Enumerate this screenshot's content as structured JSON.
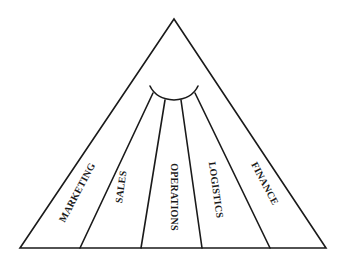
{
  "diagram": {
    "type": "pyramid-segments",
    "shape": "triangle",
    "segments": [
      {
        "label": "MARKETING"
      },
      {
        "label": "SALES"
      },
      {
        "label": "OPERATIONS"
      },
      {
        "label": "LOGISTICS"
      },
      {
        "label": "FINANCE"
      }
    ],
    "connector": "arc",
    "colors": {
      "stroke": "#1a1a1a",
      "background": "#ffffff"
    }
  }
}
